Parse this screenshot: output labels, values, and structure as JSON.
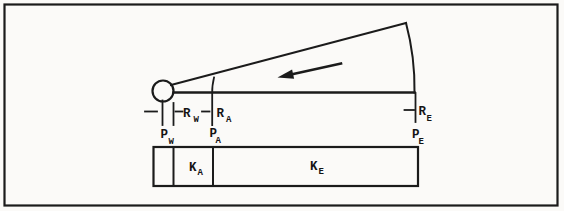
{
  "figure": {
    "type": "wedge-pressure-diagram",
    "background": "#fbfaf8",
    "line_color": "#1b1b1b",
    "text_color": "#141414",
    "arrow_direction": "left",
    "radius_labels": {
      "rw": {
        "main": "R",
        "sub": "W"
      },
      "ra": {
        "main": "R",
        "sub": "A"
      },
      "re": {
        "main": "R",
        "sub": "E"
      }
    },
    "point_labels": {
      "pw": {
        "main": "P",
        "sub": "W"
      },
      "pa": {
        "main": "P",
        "sub": "A"
      },
      "pe": {
        "main": "P",
        "sub": "E"
      }
    },
    "bar_labels": {
      "ka": {
        "main": "K",
        "sub": "A"
      },
      "ke": {
        "main": "K",
        "sub": "E"
      }
    }
  }
}
